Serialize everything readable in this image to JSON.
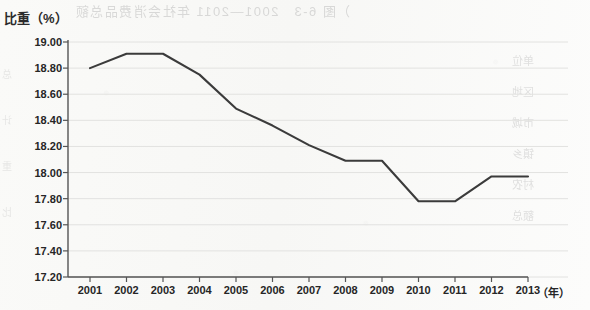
{
  "chart_data": {
    "type": "line",
    "title": "",
    "xlabel": "年",
    "ylabel": "比重（%）",
    "categories": [
      "2001",
      "2002",
      "2003",
      "2004",
      "2005",
      "2006",
      "2007",
      "2008",
      "2009",
      "2010",
      "2011",
      "2012",
      "2013"
    ],
    "values": [
      18.8,
      18.91,
      18.91,
      18.75,
      18.49,
      18.36,
      18.21,
      18.09,
      18.09,
      17.78,
      17.78,
      17.97,
      17.97
    ],
    "ylim": [
      17.2,
      19.0
    ],
    "ytick_step": 0.2,
    "ytick_labels": [
      "19.00",
      "18.80",
      "18.60",
      "18.40",
      "18.20",
      "18.00",
      "17.80",
      "17.60",
      "17.40",
      "17.20"
    ],
    "grid": true,
    "legend": null,
    "series_color": "#3b3b3b",
    "axis_color": "#555555",
    "grid_color": "#e2e2e0"
  },
  "axes": {
    "y_title": "比重（%）",
    "x_unit": "（年）"
  },
  "artifacts": {
    "bleed_top_text": "）图 6-3　2001—2011 年社会消费品总额",
    "bleed_right_lines": [
      "单位",
      "区地",
      "市城",
      "镇乡",
      "村农",
      "额总"
    ],
    "bleed_left_lines": [
      "总",
      "计",
      "重",
      "比"
    ]
  }
}
